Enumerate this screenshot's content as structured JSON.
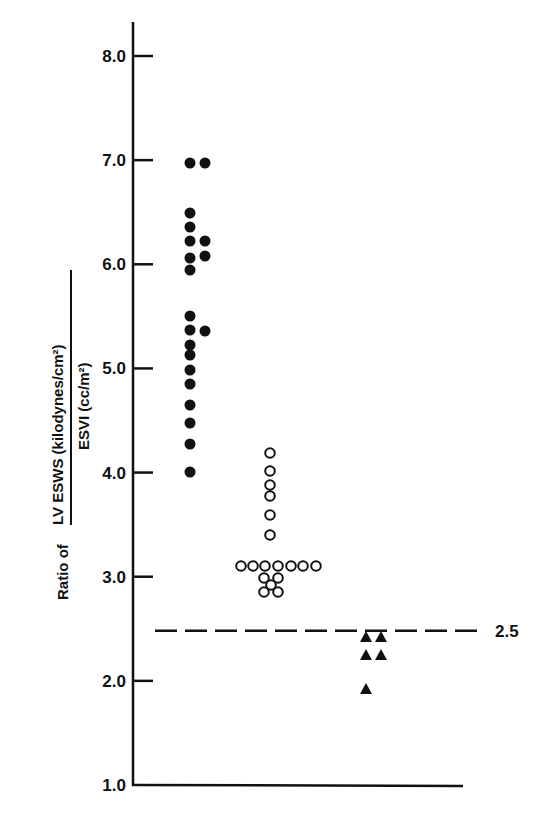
{
  "chart_data": {
    "type": "scatter",
    "title": "",
    "xlabel": "",
    "ylabel": {
      "prefix": "Ratio of",
      "numerator": "LV ESWS (kilodynes/cm²)",
      "denominator": "ESVI (cc/m²)"
    },
    "ylim": [
      1.0,
      8.0
    ],
    "yticks": [
      1.0,
      2.0,
      3.0,
      4.0,
      5.0,
      6.0,
      7.0,
      8.0
    ],
    "ytick_labels": [
      "1.0",
      "2.0",
      "3.0",
      "4.0",
      "5.0",
      "6.0",
      "7.0",
      "8.0"
    ],
    "grid": false,
    "legend": null,
    "reference_line": {
      "value": 2.5,
      "label": "2.5",
      "style": "dashed"
    },
    "series": [
      {
        "name": "Group 1",
        "marker": "filled-circle",
        "points": [
          {
            "x": 1.0,
            "y": 7.0
          },
          {
            "x": 1.3,
            "y": 7.0
          },
          {
            "x": 1.0,
            "y": 6.5
          },
          {
            "x": 1.0,
            "y": 6.36
          },
          {
            "x": 1.0,
            "y": 6.22
          },
          {
            "x": 1.3,
            "y": 6.22
          },
          {
            "x": 1.0,
            "y": 6.06
          },
          {
            "x": 1.3,
            "y": 6.07
          },
          {
            "x": 1.0,
            "y": 5.95
          },
          {
            "x": 1.0,
            "y": 5.5
          },
          {
            "x": 1.0,
            "y": 5.37
          },
          {
            "x": 1.3,
            "y": 5.36
          },
          {
            "x": 1.0,
            "y": 5.23
          },
          {
            "x": 1.0,
            "y": 5.13
          },
          {
            "x": 1.0,
            "y": 4.99
          },
          {
            "x": 1.0,
            "y": 4.85
          },
          {
            "x": 1.0,
            "y": 4.65
          },
          {
            "x": 1.0,
            "y": 4.48
          },
          {
            "x": 1.0,
            "y": 4.27
          },
          {
            "x": 1.0,
            "y": 4.0
          }
        ]
      },
      {
        "name": "Group 2",
        "marker": "open-circle",
        "points": [
          {
            "x": 2.0,
            "y": 4.18
          },
          {
            "x": 2.0,
            "y": 4.0
          },
          {
            "x": 2.0,
            "y": 3.87
          },
          {
            "x": 2.0,
            "y": 3.77
          },
          {
            "x": 2.0,
            "y": 3.59
          },
          {
            "x": 2.0,
            "y": 3.4
          },
          {
            "x": 1.45,
            "y": 3.08
          },
          {
            "x": 1.6,
            "y": 3.08
          },
          {
            "x": 1.75,
            "y": 3.08
          },
          {
            "x": 1.9,
            "y": 3.08
          },
          {
            "x": 2.05,
            "y": 3.08
          },
          {
            "x": 2.2,
            "y": 3.08
          },
          {
            "x": 2.35,
            "y": 3.08
          },
          {
            "x": 1.85,
            "y": 2.97
          },
          {
            "x": 2.0,
            "y": 2.97
          },
          {
            "x": 1.92,
            "y": 2.9
          },
          {
            "x": 1.85,
            "y": 2.83
          },
          {
            "x": 2.0,
            "y": 2.83
          }
        ]
      },
      {
        "name": "Group 3",
        "marker": "filled-triangle",
        "points": [
          {
            "x": 3.0,
            "y": 2.4
          },
          {
            "x": 3.15,
            "y": 2.4
          },
          {
            "x": 3.0,
            "y": 2.23
          },
          {
            "x": 3.15,
            "y": 2.23
          },
          {
            "x": 3.0,
            "y": 1.9
          }
        ]
      }
    ],
    "pixel_points": {
      "filled": [
        [
          190,
          163
        ],
        [
          205,
          163
        ],
        [
          190,
          213
        ],
        [
          190,
          227
        ],
        [
          190,
          241
        ],
        [
          205,
          241
        ],
        [
          190,
          258
        ],
        [
          205,
          256
        ],
        [
          190,
          270
        ],
        [
          190,
          316
        ],
        [
          190,
          330
        ],
        [
          205,
          331
        ],
        [
          190,
          345
        ],
        [
          190,
          355
        ],
        [
          190,
          370
        ],
        [
          190,
          384
        ],
        [
          190,
          405
        ],
        [
          190,
          423
        ],
        [
          190,
          444
        ],
        [
          190,
          472
        ]
      ],
      "open": [
        [
          270,
          453
        ],
        [
          270,
          471
        ],
        [
          270,
          485
        ],
        [
          270,
          496
        ],
        [
          270,
          515
        ],
        [
          270,
          535
        ],
        [
          241,
          566
        ],
        [
          253,
          566
        ],
        [
          265,
          566
        ],
        [
          278,
          566
        ],
        [
          291,
          566
        ],
        [
          303,
          566
        ],
        [
          316,
          566
        ],
        [
          264,
          578
        ],
        [
          278,
          578
        ],
        [
          271,
          585
        ],
        [
          264,
          592
        ],
        [
          278,
          592
        ]
      ],
      "triangle": [
        [
          366,
          637
        ],
        [
          381,
          637
        ],
        [
          366,
          655
        ],
        [
          381,
          655
        ],
        [
          366,
          689
        ]
      ]
    }
  }
}
